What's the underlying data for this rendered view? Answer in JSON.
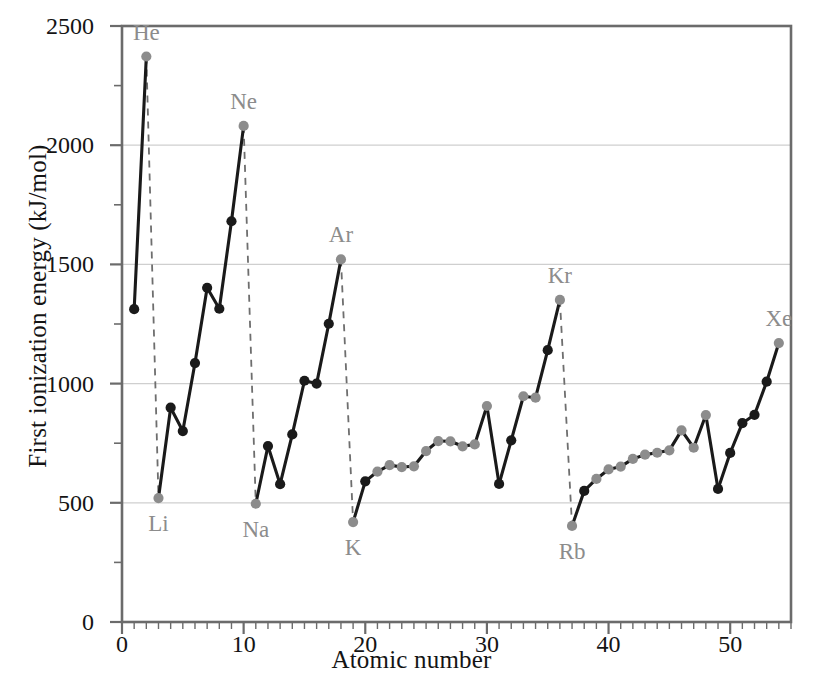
{
  "chart_data": {
    "type": "line",
    "title": "",
    "xlabel": "Atomic number",
    "ylabel": "First ionization energy (kJ/mol)",
    "xlim": [
      0,
      55
    ],
    "ylim": [
      0,
      2500
    ],
    "xticks": [
      0,
      10,
      20,
      30,
      40,
      50
    ],
    "yticks": [
      0,
      500,
      1000,
      1500,
      2000,
      2500
    ],
    "x_minor_tick_step": 1,
    "y_minor_tick_step": 250,
    "grid": "horizontal-major-only",
    "legend": "none",
    "series_color_solid": "#1a1a1a",
    "series_color_dashed": "#6e6e6e",
    "marker_color_dark": "#1a1a1a",
    "marker_color_light": "#8c8c8c",
    "gridline_color": "#cfcfcf",
    "frame_color": "#6b6b6b",
    "x": [
      1,
      2,
      3,
      4,
      5,
      6,
      7,
      8,
      9,
      10,
      11,
      12,
      13,
      14,
      15,
      16,
      17,
      18,
      19,
      20,
      21,
      22,
      23,
      24,
      25,
      26,
      27,
      28,
      29,
      30,
      31,
      32,
      33,
      34,
      35,
      36,
      37,
      38,
      39,
      40,
      41,
      42,
      43,
      44,
      45,
      46,
      47,
      48,
      49,
      50,
      51,
      52,
      53,
      54
    ],
    "symbols": [
      "H",
      "He",
      "Li",
      "Be",
      "B",
      "C",
      "N",
      "O",
      "F",
      "Ne",
      "Na",
      "Mg",
      "Al",
      "Si",
      "P",
      "S",
      "Cl",
      "Ar",
      "K",
      "Ca",
      "Sc",
      "Ti",
      "V",
      "Cr",
      "Mn",
      "Fe",
      "Co",
      "Ni",
      "Cu",
      "Zn",
      "Ga",
      "Ge",
      "As",
      "Se",
      "Br",
      "Kr",
      "Rb",
      "Sr",
      "Y",
      "Zr",
      "Nb",
      "Mo",
      "Tc",
      "Ru",
      "Rh",
      "Pd",
      "Ag",
      "Cd",
      "In",
      "Sn",
      "Sb",
      "Te",
      "I",
      "Xe"
    ],
    "values": [
      1312,
      2372,
      520,
      899,
      801,
      1086,
      1402,
      1314,
      1681,
      2081,
      496,
      738,
      578,
      787,
      1012,
      1000,
      1251,
      1521,
      419,
      590,
      631,
      658,
      650,
      653,
      717,
      759,
      758,
      737,
      745,
      906,
      579,
      762,
      947,
      941,
      1140,
      1351,
      403,
      550,
      600,
      640,
      652,
      684,
      702,
      710,
      720,
      804,
      731,
      868,
      558,
      709,
      834,
      869,
      1008,
      1170
    ],
    "marker_tone": [
      "dark",
      "light",
      "light",
      "dark",
      "dark",
      "dark",
      "dark",
      "dark",
      "dark",
      "light",
      "light",
      "dark",
      "dark",
      "dark",
      "dark",
      "dark",
      "dark",
      "light",
      "light",
      "dark",
      "light",
      "light",
      "light",
      "light",
      "light",
      "light",
      "light",
      "light",
      "light",
      "light",
      "dark",
      "dark",
      "light",
      "light",
      "dark",
      "light",
      "light",
      "dark",
      "light",
      "light",
      "light",
      "light",
      "light",
      "light",
      "light",
      "light",
      "light",
      "light",
      "dark",
      "dark",
      "dark",
      "dark",
      "dark",
      "light"
    ],
    "dashed_segments": [
      {
        "from_symbol": "He",
        "to_symbol": "Li",
        "from_x": 2,
        "from_y": 2372,
        "to_x": 3,
        "to_y": 520
      },
      {
        "from_symbol": "Ne",
        "to_symbol": "Na",
        "from_x": 10,
        "from_y": 2081,
        "to_x": 11,
        "to_y": 496
      },
      {
        "from_symbol": "Ar",
        "to_symbol": "K",
        "from_x": 18,
        "from_y": 1521,
        "to_x": 19,
        "to_y": 419
      },
      {
        "from_symbol": "Kr",
        "to_symbol": "Rb",
        "from_x": 36,
        "from_y": 1351,
        "to_x": 37,
        "to_y": 403
      }
    ],
    "annotations": [
      {
        "label": "He",
        "x": 2,
        "y": 2372,
        "position": "above"
      },
      {
        "label": "Ne",
        "x": 10,
        "y": 2081,
        "position": "above"
      },
      {
        "label": "Ar",
        "x": 18,
        "y": 1521,
        "position": "above"
      },
      {
        "label": "Kr",
        "x": 36,
        "y": 1351,
        "position": "above"
      },
      {
        "label": "Xe",
        "x": 54,
        "y": 1170,
        "position": "above"
      },
      {
        "label": "Li",
        "x": 3,
        "y": 520,
        "position": "below"
      },
      {
        "label": "Na",
        "x": 11,
        "y": 496,
        "position": "below"
      },
      {
        "label": "K",
        "x": 19,
        "y": 419,
        "position": "below"
      },
      {
        "label": "Rb",
        "x": 37,
        "y": 403,
        "position": "below"
      }
    ]
  }
}
